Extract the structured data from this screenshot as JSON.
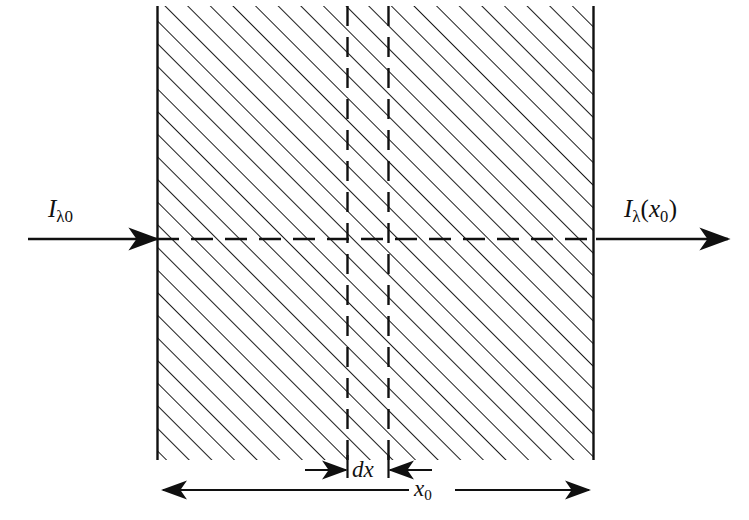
{
  "figure": {
    "background_color": "#ffffff",
    "ink_color": "#101010",
    "labels": {
      "incident_beam": {
        "symbol": "I",
        "subscript": "λ0",
        "text": "Iλ0",
        "description": "incident spectral intensity"
      },
      "transmitted_beam": {
        "symbol": "I",
        "subscript": "λ",
        "argument": "x",
        "argument_subscript": "0",
        "text": "Iλ(x0)",
        "description": "transmitted spectral intensity at depth x0"
      },
      "thickness_element": {
        "text": "dx",
        "description": "differential slab thickness"
      },
      "total_thickness": {
        "symbol": "x",
        "subscript": "0",
        "text": "x0",
        "description": "total slab thickness"
      }
    },
    "slab": {
      "fill": "hatched",
      "hatch_angle_deg": 45,
      "hatch_spacing_px": 16,
      "left_edge_x": 157,
      "right_edge_x": 594,
      "top_y": 6,
      "bottom_y": 460,
      "edges_drawn": [
        "left",
        "right"
      ]
    },
    "beam_axis": {
      "y": 239,
      "style": "dashed-inside-solid-outside",
      "entry_x": 157,
      "exit_x": 594,
      "arrow_in_start_x": 28,
      "arrow_out_end_x": 728
    },
    "dx_slice": {
      "left_line_x": 347,
      "right_line_x": 388,
      "style": "dashed",
      "top_y": 6,
      "bottom_y": 460
    },
    "dimensions": [
      {
        "name": "dx",
        "y": 470,
        "from_x": 347,
        "to_x": 388,
        "arrow_direction": "inward",
        "label": "dx"
      },
      {
        "name": "x0",
        "y": 490,
        "from_x": 162,
        "to_x": 590,
        "arrow_direction": "outward",
        "label": "x0"
      }
    ]
  }
}
